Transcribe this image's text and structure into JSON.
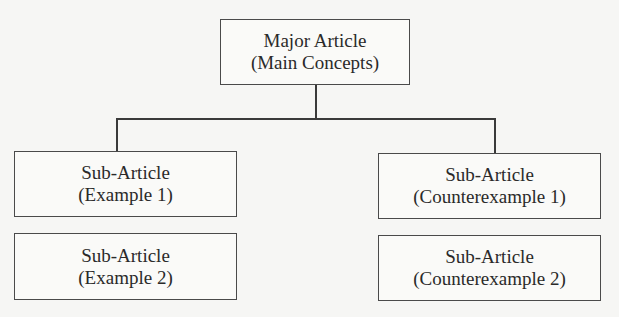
{
  "diagram": {
    "root": {
      "line1": "Major Article",
      "line2": "(Main Concepts)"
    },
    "left": [
      {
        "line1": "Sub-Article",
        "line2": "(Example 1)"
      },
      {
        "line1": "Sub-Article",
        "line2": "(Example 2)"
      }
    ],
    "right": [
      {
        "line1": "Sub-Article",
        "line2": "(Counterexample 1)"
      },
      {
        "line1": "Sub-Article",
        "line2": "(Counterexample 2)"
      }
    ]
  }
}
